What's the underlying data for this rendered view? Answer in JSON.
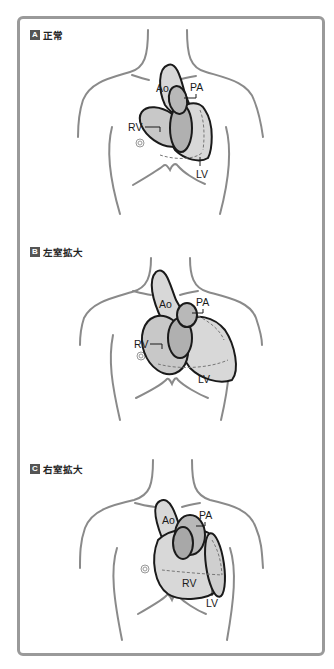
{
  "figure": {
    "panels": [
      {
        "id": "A",
        "badge": "A",
        "title": "正常",
        "labels": {
          "ao": "Ao",
          "pa": "PA",
          "rv": "RV",
          "lv": "LV"
        }
      },
      {
        "id": "B",
        "badge": "B",
        "title": "左室拡大",
        "labels": {
          "ao": "Ao",
          "pa": "PA",
          "rv": "RV",
          "lv": "LV"
        }
      },
      {
        "id": "C",
        "badge": "C",
        "title": "右室拡大",
        "labels": {
          "ao": "Ao",
          "pa": "PA",
          "rv": "RV",
          "lv": "LV"
        }
      }
    ]
  },
  "colors": {
    "frame_border": "#9a9a9a",
    "body_outline": "#8a8a8a",
    "heart_fill_light": "#dcdcdc",
    "heart_fill_dark": "#a8a8a8",
    "badge_bg": "#555555"
  }
}
